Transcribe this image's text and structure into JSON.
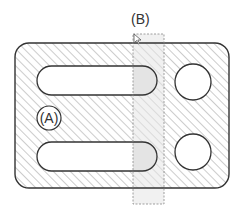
{
  "labels": {
    "a": "(A)",
    "b": "(B)"
  },
  "colors": {
    "outline": "#333333",
    "hatch": "#999999",
    "selection_fill": "#e6e6e6",
    "selection_border": "#888888",
    "background": "#ffffff"
  },
  "shapes": {
    "plate": {
      "x": 15,
      "y": 43,
      "w": 214,
      "h": 145,
      "r": 14
    },
    "slots": [
      {
        "x": 37,
        "y": 66,
        "w": 120,
        "h": 29
      },
      {
        "x": 37,
        "y": 142,
        "w": 120,
        "h": 29
      }
    ],
    "holes": [
      {
        "cx": 193,
        "cy": 82,
        "r": 18
      },
      {
        "cx": 193,
        "cy": 152,
        "r": 18
      }
    ],
    "selection_box": {
      "x": 133,
      "y": 34,
      "w": 31,
      "h": 170
    }
  }
}
